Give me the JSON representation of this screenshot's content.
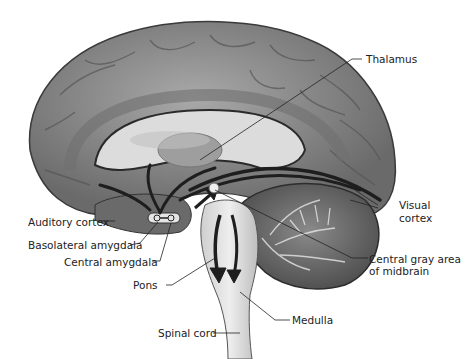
{
  "diagram": {
    "labels": [
      {
        "id": "thalamus",
        "text": "Thalamus"
      },
      {
        "id": "visual_cortex_1",
        "text": "Visual"
      },
      {
        "id": "visual_cortex_2",
        "text": "cortex"
      },
      {
        "id": "auditory_cortex",
        "text": "Auditory cortex"
      },
      {
        "id": "basolateral_amygdala",
        "text": "Basolateral amygdala"
      },
      {
        "id": "central_amygdala",
        "text": "Central amygdala"
      },
      {
        "id": "central_gray_1",
        "text": "Central gray area"
      },
      {
        "id": "central_gray_2",
        "text": "of midbrain"
      },
      {
        "id": "pons",
        "text": "Pons"
      },
      {
        "id": "medulla",
        "text": "Medulla"
      },
      {
        "id": "spinal_cord",
        "text": "Spinal cord"
      }
    ],
    "colors": {
      "cortex": "#8a8a8a",
      "cortex_dark": "#5a5a5a",
      "inner": "#d8d8d8",
      "pathway": "#1e1e1e",
      "cerebellum": "#6e6e6e",
      "brainstem": "#e2e2e2"
    }
  }
}
